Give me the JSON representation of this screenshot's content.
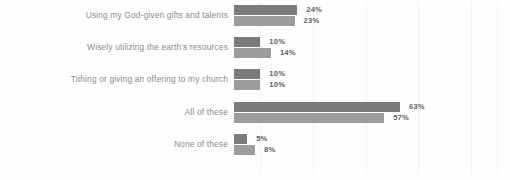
{
  "chart_data": {
    "type": "bar",
    "orientation": "horizontal",
    "title": "",
    "subtitle": "",
    "xlabel": "",
    "ylabel": "",
    "xlim": [
      0,
      100
    ],
    "grid": true,
    "legend": "none",
    "value_suffix": "%",
    "categories": [
      "Using my God-given gifts and talents",
      "Wisely utilizing the earth's resources",
      "Tithing or giving an offering to my church",
      "All of these",
      "None of these"
    ],
    "series": [
      {
        "name": "Series A",
        "color": "#7b7b7b",
        "values": [
          24,
          10,
          10,
          63,
          5
        ]
      },
      {
        "name": "Series B",
        "color": "#9c9c9c",
        "values": [
          23,
          14,
          10,
          57,
          8
        ]
      }
    ],
    "value_labels": {
      "series_a": [
        "24%",
        "10%",
        "10%",
        "63%",
        "5%"
      ],
      "series_b": [
        "23%",
        "14%",
        "10%",
        "57%",
        "8%"
      ]
    },
    "gridline_values": [
      10,
      30,
      50,
      70,
      90,
      100
    ]
  },
  "style": {
    "background": "#fefefe",
    "category_label_color": "#8c8c8c",
    "value_label_color": "#5f5f5f",
    "gridline_color": "#f1f1f1"
  }
}
